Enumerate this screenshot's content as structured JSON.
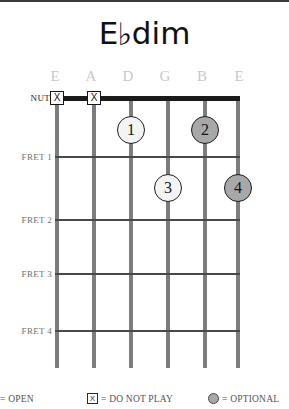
{
  "title": {
    "root": "E",
    "accidental": "♭",
    "quality": "dim",
    "full": "E♭dim"
  },
  "diagram": {
    "nut_label": "NUT",
    "string_labels": [
      "E",
      "A",
      "D",
      "G",
      "B",
      "E"
    ],
    "fret_labels": [
      "FRET 1",
      "FRET 2",
      "FRET 3",
      "FRET 4"
    ],
    "mute_marker_glyph": "X",
    "muted_strings": [
      1,
      2
    ],
    "fingerings": [
      {
        "finger": "1",
        "string": 3,
        "fret": 1,
        "style": "light"
      },
      {
        "finger": "2",
        "string": 5,
        "fret": 1,
        "style": "dark"
      },
      {
        "finger": "3",
        "string": 4,
        "fret": 2,
        "style": "light"
      },
      {
        "finger": "4",
        "string": 6,
        "fret": 2,
        "style": "dark"
      }
    ],
    "colors": {
      "nut": "#1b1b1b",
      "string": "#7d7d7d",
      "fret": "#484848",
      "string_label": "#c9c9c9",
      "fret_label": "#6f6f6f",
      "dot_light": "#f4f4f4",
      "dot_dark": "#a8a8a8"
    }
  },
  "legend": {
    "open": {
      "symbol": "open-circle",
      "text": "= OPEN"
    },
    "mute": {
      "symbol": "x-box",
      "glyph": "X",
      "text": "= DO NOT PLAY"
    },
    "optional": {
      "symbol": "filled-circle",
      "text": "= OPTIONAL"
    }
  }
}
